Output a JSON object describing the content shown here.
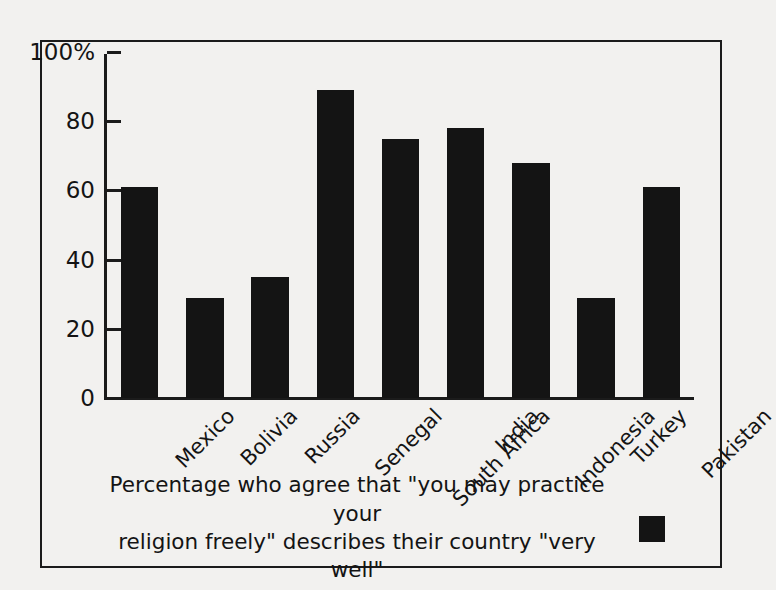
{
  "chart_data": {
    "type": "bar",
    "title": "",
    "subtitle": "",
    "xlabel": "",
    "ylabel": "",
    "ylim": [
      0,
      100
    ],
    "yticks": [
      0,
      20,
      40,
      60,
      80,
      100
    ],
    "ytick_labels": [
      "0",
      "20",
      "40",
      "60",
      "80",
      "100%"
    ],
    "grid": false,
    "legend_position": "bottom",
    "legend_entries": [
      "Percentage who agree that \"you may practice your religion freely\" describes their country \"very well\""
    ],
    "bar_color": "#141414",
    "categories": [
      "Mexico",
      "Bolivia",
      "Russia",
      "Senegal",
      "South Africa",
      "India",
      "Indonesia",
      "Turkey",
      "Pakistan"
    ],
    "values": [
      61,
      29,
      35,
      89,
      75,
      78,
      68,
      29,
      61
    ],
    "series": [
      {
        "name": "Percentage who agree that \"you may practice your religion freely\" describes their country \"very well\"",
        "values": [
          61,
          29,
          35,
          89,
          75,
          78,
          68,
          29,
          61
        ]
      }
    ]
  },
  "legend": {
    "line1": "Percentage who agree that \"you may practice your",
    "line2": "religion freely\" describes their country \"very well\"",
    "swatch_color": "#141414"
  },
  "colors": {
    "background": "#f2f1ef",
    "ink": "#1b1b1b",
    "bar": "#141414"
  }
}
